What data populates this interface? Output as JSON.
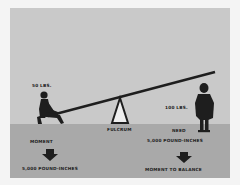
{
  "diagram": {
    "type": "seesaw-lever-illustration",
    "colors": {
      "sky": "#c9c9c9",
      "ground": "#a9a9a9",
      "ink": "#1e1e1e",
      "fulcrum_fill": "#eeeeee"
    },
    "left_side": {
      "weight_label": "50 LBS.",
      "heading": "MOMENT",
      "arrow": "down-arrow",
      "result": "5,000 POUND-INCHES"
    },
    "fulcrum_label": "FULCRUM",
    "right_side": {
      "weight_label": "100 LBS.",
      "need_line1": "NEED",
      "need_line2": "5,000 POUND-INCHES",
      "arrow": "down-arrow",
      "result": "MOMENT TO BALANCE"
    }
  }
}
